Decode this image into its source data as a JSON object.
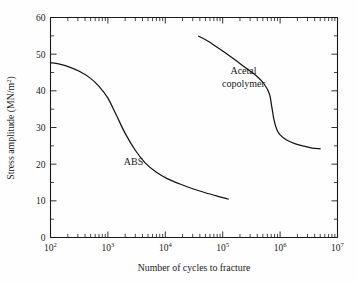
{
  "chart_data": {
    "type": "line",
    "title": "",
    "xlabel": "Number of cycles to fracture",
    "ylabel": "Stress amplitude (MN/m²)",
    "ylabel_base": "Stress amplitude (MN/m",
    "ylabel_sup": "2",
    "ylabel_close": ")",
    "xscale": "log",
    "yscale": "linear",
    "xlim": [
      100,
      10000000
    ],
    "ylim": [
      0,
      60
    ],
    "grid": false,
    "legend": "inline-annotations",
    "x_tick_labels": [
      "10²",
      "10³",
      "10⁴",
      "10⁵",
      "10⁶",
      "10⁷"
    ],
    "x_tick_bases": [
      "10",
      "10",
      "10",
      "10",
      "10",
      "10"
    ],
    "x_tick_exponents": [
      "2",
      "3",
      "4",
      "5",
      "6",
      "7"
    ],
    "x_tick_values": [
      100,
      1000,
      10000,
      100000,
      1000000,
      10000000
    ],
    "y_tick_labels": [
      "0",
      "10",
      "20",
      "30",
      "40",
      "50",
      "60"
    ],
    "y_tick_values": [
      0,
      10,
      20,
      30,
      40,
      50,
      60
    ],
    "y_minor_step": 5,
    "series": [
      {
        "name": "ABS",
        "label": "ABS",
        "label_x": 2800,
        "label_y": 19.8,
        "color": "#141414",
        "x": [
          100,
          150,
          220,
          330,
          500,
          700,
          1000,
          1400,
          2000,
          3000,
          4500,
          7000,
          11000,
          18000,
          30000,
          50000,
          80000,
          125000
        ],
        "y": [
          47.7,
          47.2,
          46.4,
          45.2,
          43.4,
          41.2,
          38.0,
          33.4,
          28.4,
          23.8,
          20.3,
          17.8,
          16.0,
          14.6,
          13.3,
          12.2,
          11.3,
          10.5
        ]
      },
      {
        "name": "Acetal copolymer",
        "label_line1": "Acetal",
        "label_line2": "copolymer",
        "label_x": 230000,
        "label_y": 44.5,
        "color": "#141414",
        "x": [
          38000,
          55000,
          80000,
          120000,
          180000,
          260000,
          380000,
          520000,
          650000,
          720000,
          790000,
          880000,
          1000000,
          1300000,
          1800000,
          2600000,
          3600000,
          5000000
        ],
        "y": [
          54.9,
          53.6,
          51.9,
          50.0,
          48.0,
          46.1,
          44.2,
          42.0,
          39.2,
          35.4,
          31.8,
          29.4,
          28.0,
          26.6,
          25.6,
          24.9,
          24.4,
          24.2
        ]
      }
    ]
  },
  "axes": {
    "x_axis_title": "Number of cycles to fracture",
    "y_axis_title_base": "Stress amplitude (MN/m",
    "y_axis_title_sup": "2",
    "y_axis_title_close": ")"
  },
  "colors": {
    "background": "#fefefe",
    "frame": "#1a1a1a",
    "curve": "#141414",
    "text": "#1a1a1a"
  }
}
